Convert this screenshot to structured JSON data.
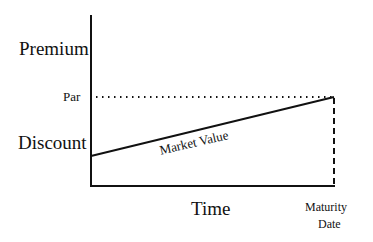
{
  "diagram": {
    "y_labels": {
      "premium": "Premium",
      "par": "Par",
      "discount": "Discount"
    },
    "x_label": "Time",
    "maturity_label_line1": "Maturity",
    "maturity_label_line2": "Date",
    "curve_label": "Market Value",
    "colors": {
      "line": "#111111",
      "background": "#ffffff"
    }
  }
}
